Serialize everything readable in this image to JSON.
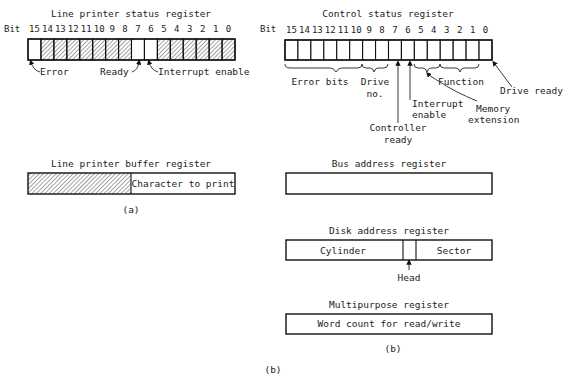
{
  "lp_status": {
    "title": "Line printer status register",
    "bit_label": "Bit",
    "bits": [
      "15",
      "14",
      "13",
      "12",
      "11",
      "10",
      "9",
      "8",
      "7",
      "6",
      "5",
      "4",
      "3",
      "2",
      "1",
      "0"
    ],
    "hatched": [
      false,
      true,
      true,
      true,
      true,
      true,
      true,
      true,
      false,
      false,
      true,
      true,
      true,
      true,
      true,
      true
    ],
    "labels": {
      "error": "Error",
      "ready": "Ready",
      "interrupt_enable": "Interrupt enable"
    }
  },
  "lp_buffer": {
    "title": "Line printer buffer register",
    "field": "Character to print",
    "caption": "(a)"
  },
  "csr": {
    "title": "Control status register",
    "bit_label": "Bit",
    "bits": [
      "15",
      "14",
      "13",
      "12",
      "11",
      "10",
      "9",
      "8",
      "7",
      "6",
      "5",
      "4",
      "3",
      "2",
      "1",
      "0"
    ],
    "labels": {
      "error_bits": "Error bits",
      "drive_no_1": "Drive",
      "drive_no_2": "no.",
      "function": "Function",
      "drive_ready": "Drive ready",
      "interrupt_1": "Interrupt",
      "interrupt_2": "enable",
      "memory_1": "Memory",
      "memory_2": "extension",
      "controller_1": "Controller",
      "controller_2": "ready"
    }
  },
  "bus_address": {
    "title": "Bus address register"
  },
  "disk_address": {
    "title": "Disk address register",
    "cylinder": "Cylinder",
    "sector": "Sector",
    "head": "Head"
  },
  "multipurpose": {
    "title": "Multipurpose register",
    "field": "Word count for read/write",
    "caption": "(b)"
  },
  "figure_caption": "(b)"
}
